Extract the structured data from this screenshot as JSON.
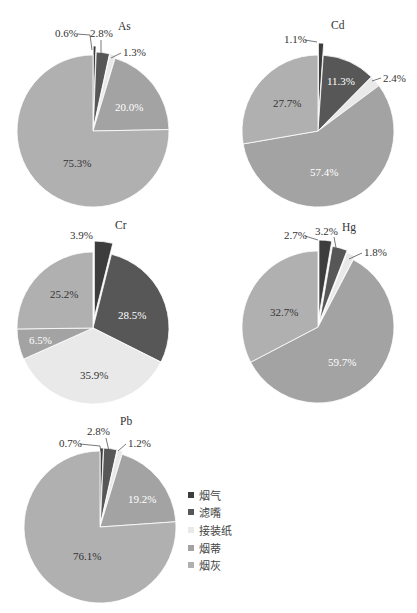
{
  "chart_data": [
    {
      "type": "pie",
      "title": "As",
      "categories": [
        "烟气",
        "滤嘴",
        "接装纸",
        "烟蒂",
        "烟灰"
      ],
      "values": [
        0.6,
        2.8,
        1.3,
        20.0,
        75.3
      ],
      "labels": [
        "0.6%",
        "2.8%",
        "1.3%",
        "20.0%",
        "75.3%"
      ],
      "start_angle": "12 o'clock, clockwise"
    },
    {
      "type": "pie",
      "title": "Cd",
      "categories": [
        "烟气",
        "滤嘴",
        "接装纸",
        "烟蒂",
        "烟灰"
      ],
      "values": [
        1.1,
        11.3,
        2.4,
        57.4,
        27.7
      ],
      "labels": [
        "1.1%",
        "11.3%",
        "2.4%",
        "57.4%",
        "27.7%"
      ],
      "start_angle": "12 o'clock, clockwise"
    },
    {
      "type": "pie",
      "title": "Cr",
      "categories": [
        "烟气",
        "滤嘴",
        "接装纸",
        "烟蒂",
        "烟灰"
      ],
      "values": [
        3.9,
        28.5,
        35.9,
        6.5,
        25.2
      ],
      "labels": [
        "3.9%",
        "28.5%",
        "35.9%",
        "6.5%",
        "25.2%"
      ],
      "start_angle": "12 o'clock, clockwise"
    },
    {
      "type": "pie",
      "title": "Hg",
      "categories": [
        "烟气",
        "滤嘴",
        "接装纸",
        "烟蒂",
        "烟灰"
      ],
      "values": [
        2.7,
        3.2,
        1.8,
        59.7,
        32.7
      ],
      "labels": [
        "2.7%",
        "3.2%",
        "1.8%",
        "59.7%",
        "32.7%"
      ],
      "start_angle": "12 o'clock, clockwise"
    },
    {
      "type": "pie",
      "title": "Pb",
      "categories": [
        "烟气",
        "滤嘴",
        "接装纸",
        "烟蒂",
        "烟灰"
      ],
      "values": [
        0.7,
        2.8,
        1.2,
        19.2,
        76.1
      ],
      "labels": [
        "0.7%",
        "2.8%",
        "1.2%",
        "19.2%",
        "76.1%"
      ],
      "start_angle": "12 o'clock, clockwise"
    }
  ],
  "legend": {
    "position": "right of Pb chart",
    "items": [
      {
        "label": "烟气",
        "color": "#3d3d3d"
      },
      {
        "label": "滤嘴",
        "color": "#575757"
      },
      {
        "label": "接装纸",
        "color": "#e9e9e9"
      },
      {
        "label": "烟蒂",
        "color": "#a3a3a3"
      },
      {
        "label": "烟灰",
        "color": "#b0b0b0"
      }
    ]
  }
}
